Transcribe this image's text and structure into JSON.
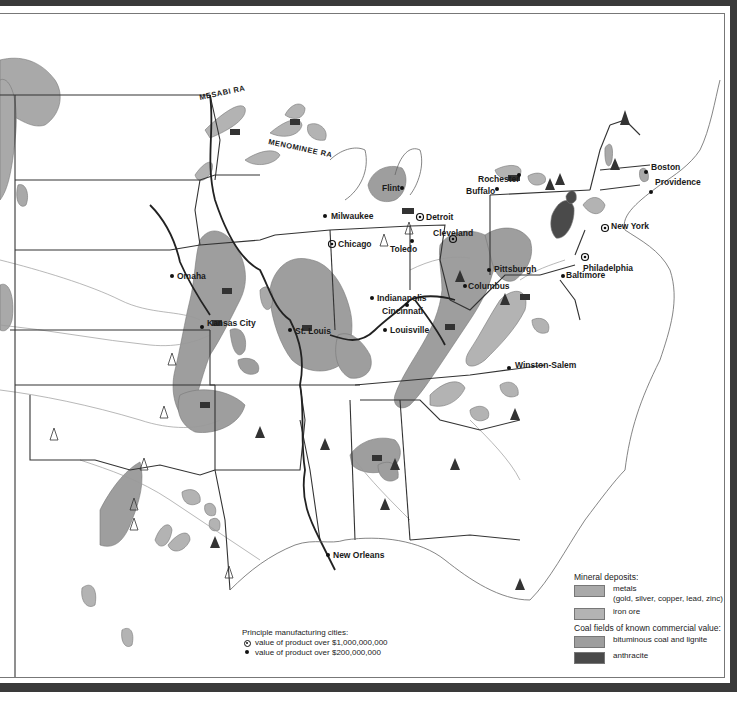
{
  "map": {
    "region": "Eastern United States",
    "range_labels": [
      {
        "text": "MESABI RA",
        "x": 200,
        "y": 100
      },
      {
        "text": "MENOMINEE RA",
        "x": 268,
        "y": 144
      }
    ],
    "cities": [
      {
        "name": "Milwaukee",
        "x": 325,
        "y": 205,
        "size": "small"
      },
      {
        "name": "Detroit",
        "x": 420,
        "y": 203,
        "size": "large"
      },
      {
        "name": "Flint",
        "x": 402,
        "y": 175,
        "size": "small"
      },
      {
        "name": "Chicago",
        "x": 332,
        "y": 230,
        "size": "large"
      },
      {
        "name": "Toledo",
        "x": 412,
        "y": 227,
        "size": "small"
      },
      {
        "name": "Cleveland",
        "x": 453,
        "y": 225,
        "size": "large"
      },
      {
        "name": "Buffalo",
        "x": 497,
        "y": 175,
        "size": "small"
      },
      {
        "name": "Rochester",
        "x": 519,
        "y": 161,
        "size": "small"
      },
      {
        "name": "Boston",
        "x": 646,
        "y": 158,
        "size": "small"
      },
      {
        "name": "Providence",
        "x": 651,
        "y": 178,
        "size": "small"
      },
      {
        "name": "New York",
        "x": 605,
        "y": 214,
        "size": "large"
      },
      {
        "name": "Philadelphia",
        "x": 585,
        "y": 244,
        "size": "large"
      },
      {
        "name": "Baltimore",
        "x": 563,
        "y": 262,
        "size": "small"
      },
      {
        "name": "Pittsburgh",
        "x": 489,
        "y": 257,
        "size": "small"
      },
      {
        "name": "Columbus",
        "x": 465,
        "y": 273,
        "size": "small"
      },
      {
        "name": "Omaha",
        "x": 172,
        "y": 262,
        "size": "small"
      },
      {
        "name": "Indianapolis",
        "x": 372,
        "y": 284,
        "size": "small"
      },
      {
        "name": "Cincinnati",
        "x": 407,
        "y": 291,
        "size": "small"
      },
      {
        "name": "Kansas City",
        "x": 202,
        "y": 313,
        "size": "small"
      },
      {
        "name": "St. Louis",
        "x": 290,
        "y": 316,
        "size": "small"
      },
      {
        "name": "Louisville",
        "x": 385,
        "y": 316,
        "size": "small"
      },
      {
        "name": "Winston-Salem",
        "x": 509,
        "y": 354,
        "size": "small"
      },
      {
        "name": "New Orleans",
        "x": 328,
        "y": 541,
        "size": "small"
      }
    ]
  },
  "legend": {
    "mineral_title": "Mineral deposits:",
    "metals_label": "metals",
    "metals_detail": "(gold, silver, copper, lead, zinc)",
    "iron_label": "iron ore",
    "coal_title": "Coal fields of known commercial value:",
    "bituminous_label": "bituminous coal and lignite",
    "anthracite_label": "anthracite",
    "cities_title": "Principle manufacturing cities:",
    "large_city_label": "value of product over $1,000,000,000",
    "small_city_label": "value of product over $200,000,000"
  },
  "colors": {
    "metals": "#a9a9a9",
    "iron_ore": "#b3b3b3",
    "bituminous": "#9e9e9e",
    "anthracite": "#4a4a4a",
    "frame": "#3a3a3a",
    "boundary": "#333333",
    "river": "#999999"
  }
}
